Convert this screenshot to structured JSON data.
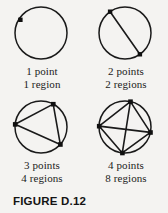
{
  "figure": {
    "caption": "FIGURE D.12",
    "background_color": "#f4f3f1",
    "ink_color": "#1a1a1a"
  },
  "panels": [
    {
      "id": "one-point",
      "points_label": "1 point",
      "regions_label": "1 region",
      "points": 1,
      "regions": 1,
      "chords": 0
    },
    {
      "id": "two-points",
      "points_label": "2 points",
      "regions_label": "2 regions",
      "points": 2,
      "regions": 2,
      "chords": 1
    },
    {
      "id": "three-points",
      "points_label": "3 points",
      "regions_label": "4 regions",
      "points": 3,
      "regions": 4,
      "chords": 3
    },
    {
      "id": "four-points",
      "points_label": "4 points",
      "regions_label": "8 regions",
      "points": 4,
      "regions": 8,
      "chords": 6
    }
  ]
}
